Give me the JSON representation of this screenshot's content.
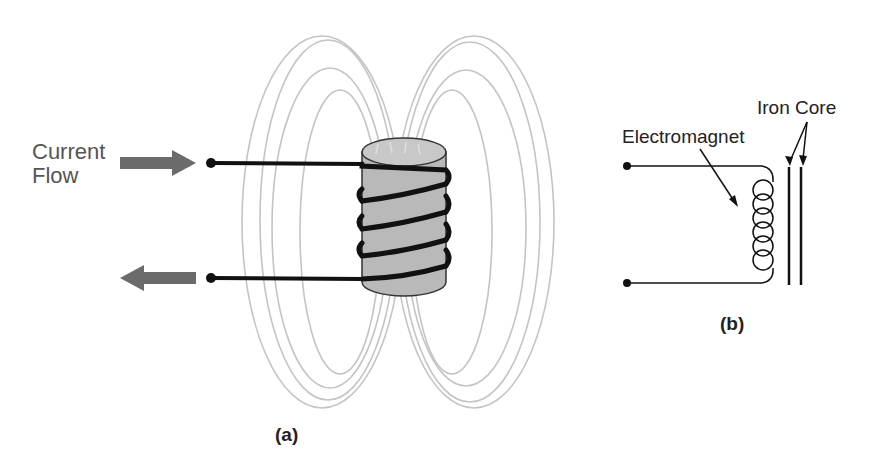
{
  "figure_a": {
    "caption": "(a)",
    "current_label_line1": "Current",
    "current_label_line2": "Flow",
    "arrow_in_direction": "right",
    "arrow_out_direction": "left",
    "colors": {
      "arrow": "#6b6b6b",
      "core": "#b9b9b9",
      "wire": "#111111",
      "field_lines": "#c4c4c4"
    },
    "coil_turns": 4
  },
  "figure_b": {
    "caption": "(b)",
    "electromagnet_label": "Electromagnet",
    "iron_core_label": "Iron Core",
    "inductor_loops": 6
  }
}
